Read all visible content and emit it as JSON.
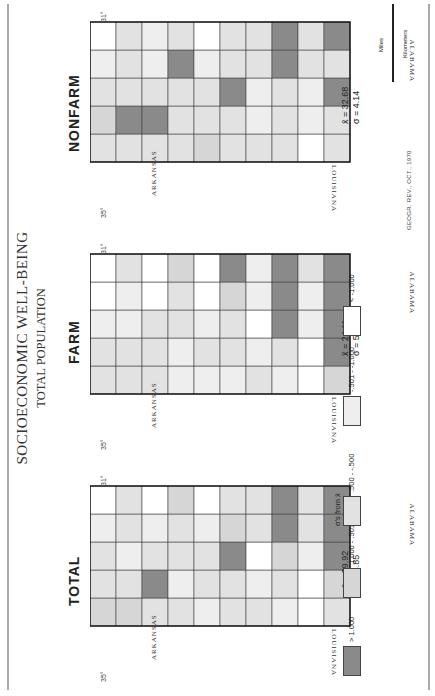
{
  "figure": {
    "title": "SOCIOECONOMIC WELL-BEING",
    "subtitle": "TOTAL POPULATION",
    "source_note": "GEOGR. REV., OCT., 1970",
    "states": {
      "north": "ARKANSAS",
      "south": "ALABAMA",
      "west": "LOUISIANA"
    },
    "grid_labels": {
      "lat": [
        "35°",
        "34°",
        "33°",
        "32°",
        "31°"
      ],
      "lon": [
        "91°",
        "90°",
        "89°"
      ]
    },
    "colors": {
      "class_high": "#8a8a8a",
      "class_mid_high": "#d6d6d6",
      "class_mid": "#e2e2e2",
      "class_mid_low": "#eeeeee",
      "class_low": "#ffffff"
    }
  },
  "panels": [
    {
      "id": "total",
      "label": "TOTAL",
      "mean_label": "x̄ = 29.92",
      "sd_label": "σ = 4.85"
    },
    {
      "id": "farm",
      "label": "FARM",
      "mean_label": "x̄ = 24.11",
      "sd_label": "σ = 5.24"
    },
    {
      "id": "nonfarm",
      "label": "NONFARM",
      "mean_label": "x̄ = 32.68",
      "sd_label": "σ = 4.14"
    }
  ],
  "legend": {
    "title": "σ's from x̄",
    "classes": [
      {
        "label": "> 1.000",
        "key": "class_high"
      },
      {
        "label": "1.000 - .501",
        "key": "class_mid_high"
      },
      {
        "label": ".500 - -.500",
        "key": "class_mid"
      },
      {
        "label": "-.501 - -1.000",
        "key": "class_mid_low"
      },
      {
        "label": "< -1.000",
        "key": "class_low"
      }
    ]
  },
  "scale_bar": {
    "miles_label": "Miles",
    "km_label": "Kilometers",
    "miles_ticks": [
      "0",
      "20",
      "40",
      "60",
      "80",
      "100"
    ],
    "km_ticks": [
      "0",
      "20",
      "40",
      "60",
      "80",
      "100",
      "120",
      "140",
      "160"
    ]
  }
}
